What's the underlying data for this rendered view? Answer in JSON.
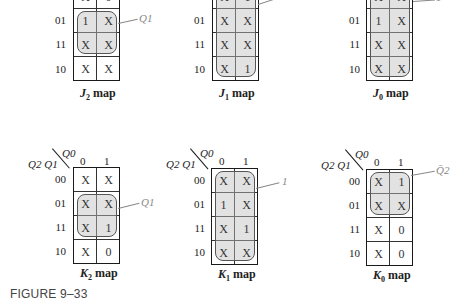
{
  "figure": {
    "caption": "FIGURE 9–33",
    "row_labels": [
      "00",
      "01",
      "11",
      "10"
    ],
    "col_labels": [
      "0",
      "1"
    ],
    "row_var_label": "Q2 Q1",
    "col_var_label": "Q0",
    "maps": [
      {
        "id": "J2",
        "label_letter": "J",
        "label_sub": "2",
        "label_suffix": " map",
        "cells": [
          [
            "X",
            "0"
          ],
          [
            "1",
            "X"
          ],
          [
            "X",
            "X"
          ],
          [
            "X",
            "X"
          ]
        ],
        "group_label": "Q1",
        "group_rows": [
          1,
          2
        ],
        "group_cols": [
          0,
          1
        ]
      },
      {
        "id": "J1",
        "label_letter": "J",
        "label_sub": "1",
        "label_suffix": " map",
        "cells": [
          [
            "X",
            "1"
          ],
          [
            "X",
            "X"
          ],
          [
            "X",
            "X"
          ],
          [
            "X",
            "1"
          ]
        ],
        "group_label": "1",
        "group_rows": [
          0,
          3
        ],
        "group_cols": [
          0,
          1
        ]
      },
      {
        "id": "J0",
        "label_letter": "J",
        "label_sub": "0",
        "label_suffix": " map",
        "cells": [
          [
            "X",
            "X"
          ],
          [
            "1",
            "X"
          ],
          [
            "X",
            "X"
          ],
          [
            "X",
            "X"
          ]
        ],
        "group_label": "1",
        "group_rows": [
          0,
          3
        ],
        "group_cols": [
          0,
          1
        ]
      },
      {
        "id": "K2",
        "label_letter": "K",
        "label_sub": "2",
        "label_suffix": " map",
        "cells": [
          [
            "X",
            "X"
          ],
          [
            "X",
            "X"
          ],
          [
            "X",
            "1"
          ],
          [
            "X",
            "0"
          ]
        ],
        "group_label": "Q1",
        "group_rows": [
          1,
          2
        ],
        "group_cols": [
          0,
          1
        ]
      },
      {
        "id": "K1",
        "label_letter": "K",
        "label_sub": "1",
        "label_suffix": " map",
        "cells": [
          [
            "X",
            "X"
          ],
          [
            "1",
            "X"
          ],
          [
            "X",
            "1"
          ],
          [
            "X",
            "X"
          ]
        ],
        "group_label": "1",
        "group_rows": [
          0,
          3
        ],
        "group_cols": [
          0,
          1
        ]
      },
      {
        "id": "K0",
        "label_letter": "K",
        "label_sub": "0",
        "label_suffix": " map",
        "cells": [
          [
            "X",
            "1"
          ],
          [
            "X",
            "X"
          ],
          [
            "X",
            "0"
          ],
          [
            "X",
            "0"
          ]
        ],
        "group_label": "Q̄2",
        "group_rows": [
          0,
          1
        ],
        "group_cols": [
          0,
          1
        ]
      }
    ]
  }
}
